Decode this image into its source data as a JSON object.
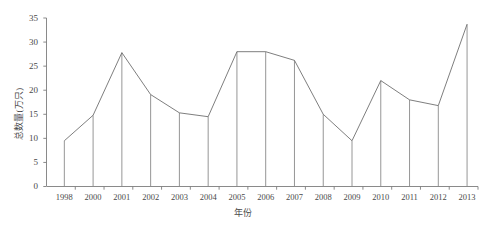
{
  "chart_data": {
    "type": "line",
    "title": "",
    "title_note": "title row cropped at top edge, illegible",
    "xlabel": "年份",
    "ylabel": "总数量(万只)",
    "categories": [
      "1998",
      "2000",
      "2001",
      "2002",
      "2003",
      "2004",
      "2005",
      "2006",
      "2007",
      "2008",
      "2009",
      "2010",
      "2011",
      "2012",
      "2013"
    ],
    "values": [
      9.5,
      14.8,
      27.8,
      19.1,
      15.3,
      14.5,
      28.0,
      28.0,
      26.2,
      15.0,
      9.5,
      22.0,
      18.0,
      16.8,
      33.7
    ],
    "ylim": [
      0,
      35
    ],
    "yticks": [
      0,
      5,
      10,
      15,
      20,
      25,
      30,
      35
    ],
    "grid": false,
    "legend": false,
    "drop_lines": true,
    "line_color": "#6f6f6f",
    "axis_color": "#7d7d7d",
    "background": "#ffffff"
  },
  "axis": {
    "y_tick_labels": [
      "0",
      "5",
      "10",
      "15",
      "20",
      "25",
      "30",
      "35"
    ],
    "x_tick_labels": [
      "1998",
      "2000",
      "2001",
      "2002",
      "2003",
      "2004",
      "2005",
      "2006",
      "2007",
      "2008",
      "2009",
      "2010",
      "2011",
      "2012",
      "2013"
    ]
  }
}
